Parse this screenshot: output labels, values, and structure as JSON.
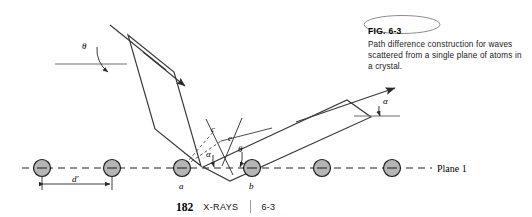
{
  "figure": {
    "number_label": "FIG. 6-3",
    "caption": "Path difference construction for waves scattered from a single plane of atoms in a crystal.",
    "plane_label": "Plane 1",
    "spacing_label": "d'",
    "point_labels": {
      "a": "a",
      "b": "b",
      "c": "c",
      "e": "e"
    },
    "angle_labels": {
      "incident_theta": "θ",
      "plane_alpha": "α",
      "plane_theta": "θ",
      "scattered_alpha": "α"
    },
    "colors": {
      "atom_fill": "#b5b5b5",
      "atom_stroke": "#1a1a1a",
      "line": "#3a3a3a",
      "dashed_plane": "#707070",
      "text": "#000000"
    },
    "atom_count": 6
  },
  "footer": {
    "page_number": "182",
    "section_title": "X-RAYS",
    "section_number": "6-3"
  }
}
